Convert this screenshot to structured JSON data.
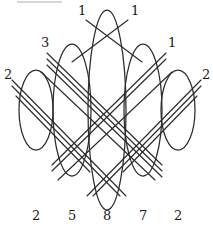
{
  "figure": {
    "background": "#ffffff",
    "stroke_color": "#2b2b2b",
    "artifact_bar": {
      "present": true,
      "color": "#d8d8d8"
    }
  },
  "ellipses": [
    {
      "id": "ellipse-1",
      "cx": 36,
      "cy": 110,
      "rx": 17,
      "ry": 40,
      "bottom_label": "2"
    },
    {
      "id": "ellipse-2",
      "cx": 72,
      "cy": 110,
      "rx": 19,
      "ry": 66,
      "bottom_label": "5"
    },
    {
      "id": "ellipse-3",
      "cx": 107,
      "cy": 110,
      "rx": 19,
      "ry": 100,
      "bottom_label": "8"
    },
    {
      "id": "ellipse-4",
      "cx": 143,
      "cy": 110,
      "rx": 19,
      "ry": 66,
      "bottom_label": "7"
    },
    {
      "id": "ellipse-5",
      "cx": 178,
      "cy": 110,
      "rx": 17,
      "ry": 40,
      "bottom_label": "2"
    }
  ],
  "edge_labels": [
    {
      "id": "label-top-left",
      "text": "1",
      "x": 78,
      "y": 6,
      "multiplicity": 1
    },
    {
      "id": "label-top-right",
      "text": "1",
      "x": 131,
      "y": 6,
      "multiplicity": 1
    },
    {
      "id": "label-upper-left",
      "text": "3",
      "x": 41,
      "y": 38,
      "multiplicity": 3
    },
    {
      "id": "label-upper-right",
      "text": "1",
      "x": 168,
      "y": 38,
      "multiplicity": 1
    },
    {
      "id": "label-mid-left",
      "text": "2",
      "x": 4,
      "y": 70,
      "multiplicity": 2
    },
    {
      "id": "label-mid-right",
      "text": "2",
      "x": 202,
      "y": 70,
      "multiplicity": 2
    }
  ],
  "bottom_labels": [
    {
      "id": "bottom-label-1",
      "text": "2",
      "x": 32,
      "y": 210
    },
    {
      "id": "bottom-label-2",
      "text": "5",
      "x": 68,
      "y": 210
    },
    {
      "id": "bottom-label-3",
      "text": "8",
      "x": 103,
      "y": 210
    },
    {
      "id": "bottom-label-4",
      "text": "7",
      "x": 139,
      "y": 210
    },
    {
      "id": "bottom-label-5",
      "text": "2",
      "x": 174,
      "y": 210
    }
  ],
  "chords": {
    "group_top_left": {
      "count": 1,
      "from_x": 80,
      "from_y": 22,
      "to_x": 132,
      "to_y": 60
    },
    "group_top_right": {
      "count": 1,
      "from_x": 132,
      "from_y": 22,
      "to_x": 80,
      "to_y": 60
    },
    "group_three": {
      "count": 3,
      "label": "3"
    },
    "group_one_right": {
      "count": 1,
      "label": "1"
    },
    "group_two_left": {
      "count": 2,
      "label": "2"
    },
    "group_two_right": {
      "count": 2,
      "label": "2"
    }
  }
}
